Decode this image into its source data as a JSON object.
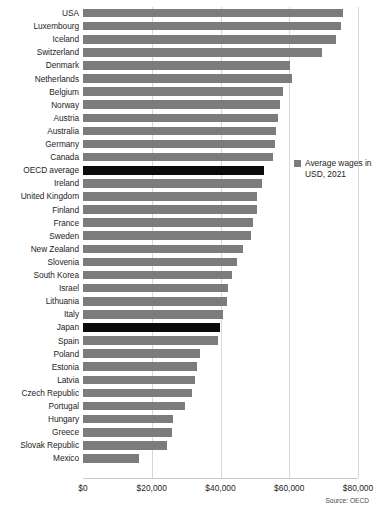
{
  "chart_data": {
    "type": "bar",
    "orientation": "horizontal",
    "title": "",
    "subtitle": "",
    "xlabel": "",
    "ylabel": "",
    "xlim": [
      0,
      80000
    ],
    "grid": true,
    "legend_position": "right",
    "source": "Source: OECD",
    "series_name": "Average wages in USD, 2021",
    "xticks": [
      "$0",
      "$20,000",
      "$40,000",
      "$60,000",
      "$80,000"
    ],
    "xtick_values": [
      0,
      20000,
      40000,
      60000,
      80000
    ],
    "highlight_color": "#0b0b0b",
    "bar_color": "#7c7c7c",
    "highlighted_categories": [
      "OECD average",
      "Japan"
    ],
    "categories": [
      "USA",
      "Luxembourg",
      "Iceland",
      "Switzerland",
      "Denmark",
      "Netherlands",
      "Belgium",
      "Norway",
      "Austria",
      "Australia",
      "Germany",
      "Canada",
      "OECD average",
      "Ireland",
      "United Kingdom",
      "Finland",
      "France",
      "Sweden",
      "New Zealand",
      "Slovenia",
      "South Korea",
      "Israel",
      "Lithuania",
      "Italy",
      "Japan",
      "Spain",
      "Poland",
      "Estonia",
      "Latvia",
      "Czech Republic",
      "Portugal",
      "Hungary",
      "Greece",
      "Slovak Republic",
      "Mexico"
    ],
    "values": [
      75700,
      75100,
      73600,
      69600,
      60300,
      60800,
      58200,
      57300,
      56600,
      56000,
      55800,
      55300,
      52700,
      52200,
      50600,
      50600,
      49500,
      48800,
      46600,
      44800,
      43300,
      42200,
      42000,
      40700,
      39900,
      39300,
      34100,
      33300,
      32700,
      31700,
      29700,
      26200,
      25900,
      24400,
      16200
    ]
  },
  "legend": {
    "label": "Average wages in USD, 2021"
  },
  "footer": {
    "source": "Source: OECD"
  }
}
